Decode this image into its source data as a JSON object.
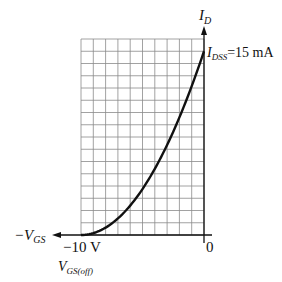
{
  "chart_data": {
    "type": "line",
    "title": "",
    "xlabel": "-V_GS",
    "ylabel": "I_D",
    "x_range": [
      -10,
      0
    ],
    "y_range": [
      0,
      16
    ],
    "grid": true,
    "grid_columns": 10,
    "grid_rows": 16,
    "x_tick_labels": [
      {
        "value": -10,
        "label": "−10 V",
        "sublabel": "V_GS(off)"
      },
      {
        "value": 0,
        "label": "0"
      }
    ],
    "annotations": [
      {
        "text": "I_DSS = 15 mA",
        "x": 0,
        "y": 15
      }
    ],
    "series": [
      {
        "name": "Transfer characteristic",
        "x": [
          -10,
          -9,
          -8,
          -7,
          -6,
          -5,
          -4,
          -3,
          -2,
          -1,
          0
        ],
        "values": [
          0,
          0.15,
          0.6,
          1.35,
          2.4,
          3.75,
          5.4,
          7.35,
          9.6,
          12.15,
          15
        ]
      }
    ]
  },
  "labels": {
    "y_axis_main": "I",
    "y_axis_sub": "D",
    "x_axis_prefix": "−V",
    "x_axis_sub": "GS",
    "idss_main": "I",
    "idss_sub": "DSS",
    "idss_value": "=15 mA",
    "xmin_label": "−10 V",
    "vgsoff_main": "V",
    "vgsoff_sub": "GS(off)",
    "zero_label": "0"
  }
}
